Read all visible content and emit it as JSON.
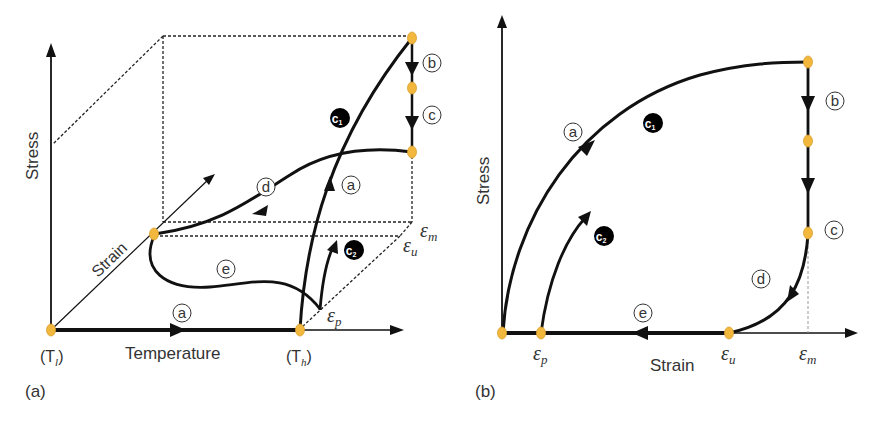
{
  "colors": {
    "stroke": "#111111",
    "point_fill": "#f2b73d",
    "point_stroke": "#d9a030",
    "dashed": "#222222",
    "text": "#333333",
    "badge_bg": "#000000"
  },
  "panel_a": {
    "caption": "(a)",
    "axes": {
      "y_label": "Stress",
      "x_label": "Temperature",
      "z_label": "Strain"
    },
    "temperature_marks": {
      "low": "(T",
      "low_sub": "l",
      "low_close": ")",
      "high": "(T",
      "high_sub": "h",
      "high_close": ")"
    },
    "strain_marks": {
      "em": "ε",
      "em_sub": "m",
      "eu": "ε",
      "eu_sub": "u",
      "ep": "ε",
      "ep_sub": "p"
    },
    "path_labels": {
      "a_bottom": "a",
      "a_curve": "a",
      "b": "b",
      "c": "c",
      "d": "d",
      "e": "e",
      "c1": "c",
      "c1_sub": "1",
      "c2": "c",
      "c2_sub": "2"
    }
  },
  "panel_b": {
    "caption": "(b)",
    "axes": {
      "y_label": "Stress",
      "x_label": "Strain"
    },
    "strain_marks": {
      "ep": "ε",
      "ep_sub": "p",
      "eu": "ε",
      "eu_sub": "u",
      "em": "ε",
      "em_sub": "m"
    },
    "path_labels": {
      "a": "a",
      "b": "b",
      "c": "c",
      "d": "d",
      "e": "e",
      "c1": "c",
      "c1_sub": "1",
      "c2": "c",
      "c2_sub": "2"
    }
  }
}
